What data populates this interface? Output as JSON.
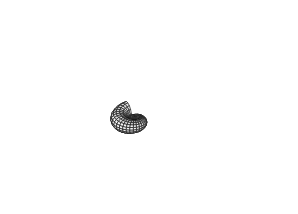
{
  "figure": {
    "background": "#ffffff",
    "stroke": "#1a1a1a",
    "fill_light": "#f4f4f4",
    "fill_shade": "#dcdcdc",
    "apex": [
      96,
      93
    ]
  }
}
